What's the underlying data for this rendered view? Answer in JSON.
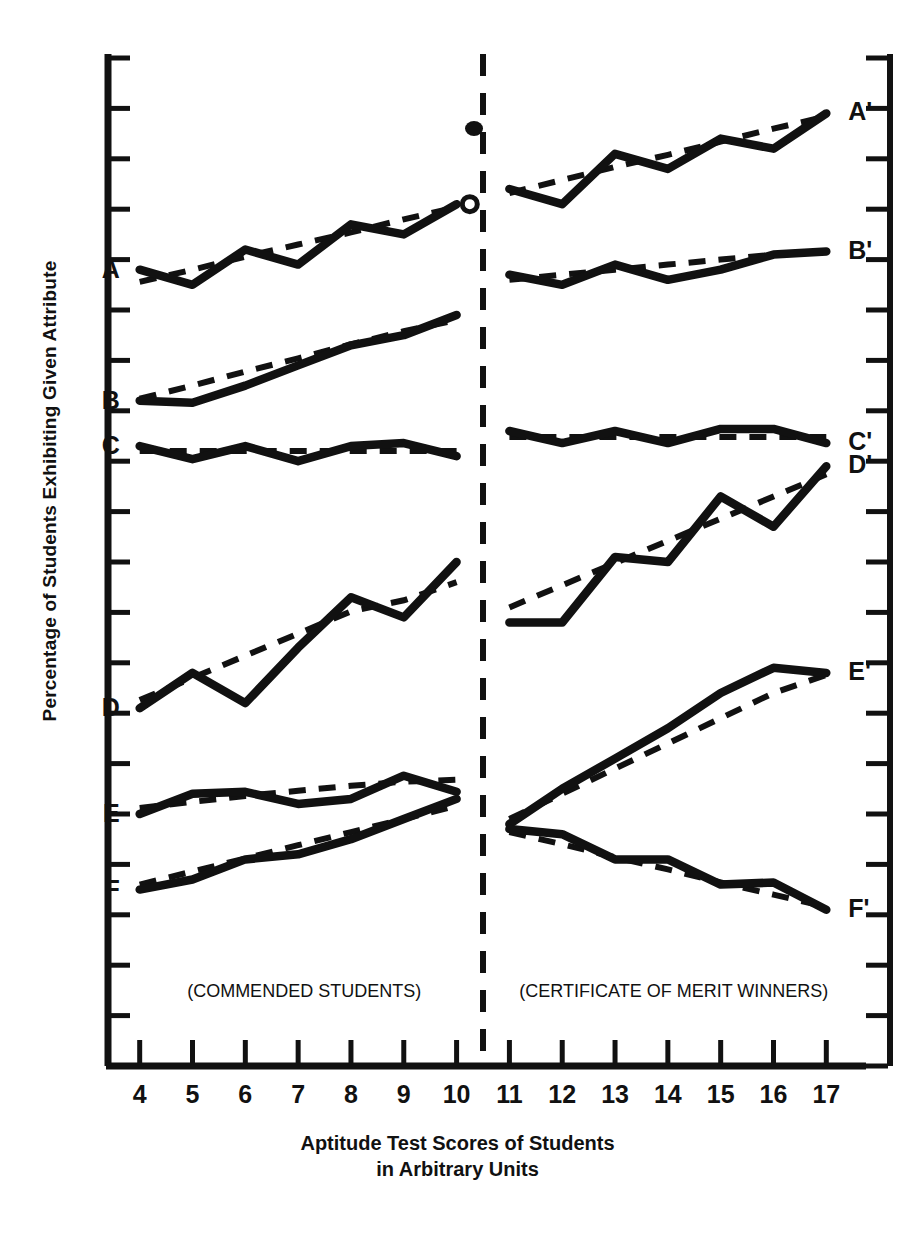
{
  "figure": {
    "ylabel": "Percentage of Students Exhibiting Given Attribute",
    "xtitle_line1": "Aptitude Test Scores of Students",
    "xtitle_line2": "in Arbitrary Units",
    "left_panel_caption": "(COMMENDED STUDENTS)",
    "right_panel_caption": "(CERTIFICATE OF MERIT WINNERS)",
    "ink_color": "#111111",
    "background_color": "#ffffff"
  },
  "chart_data": {
    "type": "line",
    "title": "",
    "xlabel": "Aptitude Test Scores of Students in Arbitrary Units",
    "ylabel": "Percentage of Students Exhibiting Given Attribute",
    "xlim": [
      3.4,
      17.6
    ],
    "ylim": [
      0,
      100
    ],
    "grid": false,
    "legend": "none",
    "axis_style": "left-spine-and-bottom-spine, unlabeled y ticks, tick marks outward",
    "y_axis_tick_count": 20,
    "y_axis_tick_labels": [],
    "x_ticks": [
      4,
      5,
      6,
      7,
      8,
      9,
      10,
      11,
      12,
      13,
      14,
      15,
      16,
      17
    ],
    "x_tick_labels": [
      "4",
      "5",
      "6",
      "7",
      "8",
      "9",
      "10",
      "11",
      "12",
      "13",
      "14",
      "15",
      "16",
      "17"
    ],
    "divider": {
      "x": 10.5,
      "style": "dashed-vertical",
      "label": "panel separator"
    },
    "panels": [
      {
        "name": "left",
        "caption": "(COMMENDED STUDENTS)",
        "x_range": [
          4,
          10
        ]
      },
      {
        "name": "right",
        "caption": "(CERTIFICATE OF MERIT WINNERS)",
        "x_range": [
          11,
          17
        ]
      }
    ],
    "series": [
      {
        "name": "A",
        "panel": "left",
        "label": "A",
        "label_side": "left",
        "x": [
          4,
          5,
          6,
          7,
          8,
          9,
          10
        ],
        "values": [
          79.0,
          77.5,
          81.0,
          79.5,
          83.5,
          82.5,
          85.5
        ],
        "trend": [
          77.8,
          79.0,
          80.3,
          81.5,
          82.7,
          84.0,
          85.2
        ]
      },
      {
        "name": "B",
        "panel": "left",
        "label": "B",
        "label_side": "left",
        "x": [
          4,
          5,
          6,
          7,
          8,
          9,
          10
        ],
        "values": [
          66.0,
          65.8,
          67.5,
          69.5,
          71.5,
          72.5,
          74.5
        ],
        "trend": [
          66.2,
          67.5,
          68.9,
          70.2,
          71.6,
          72.9,
          74.0
        ]
      },
      {
        "name": "C",
        "panel": "left",
        "label": "C",
        "label_side": "left",
        "x": [
          4,
          5,
          6,
          7,
          8,
          9,
          10
        ],
        "values": [
          61.5,
          60.2,
          61.5,
          60.0,
          61.5,
          61.8,
          60.5
        ],
        "trend": [
          61.0,
          61.0,
          61.0,
          61.0,
          61.0,
          61.0,
          61.0
        ]
      },
      {
        "name": "D",
        "panel": "left",
        "label": "D",
        "label_side": "left",
        "x": [
          4,
          5,
          6,
          7,
          8,
          9,
          10
        ],
        "values": [
          35.5,
          39.0,
          36.0,
          41.5,
          46.5,
          44.5,
          50.0
        ],
        "trend": [
          36.3,
          38.5,
          40.7,
          42.9,
          45.1,
          46.2,
          48.0
        ]
      },
      {
        "name": "E",
        "panel": "left",
        "label": "E",
        "label_side": "left",
        "x": [
          4,
          5,
          6,
          7,
          8,
          9,
          10
        ],
        "values": [
          25.0,
          27.0,
          27.2,
          26.0,
          26.5,
          28.8,
          27.2
        ],
        "trend": [
          25.6,
          26.2,
          26.8,
          27.3,
          27.8,
          28.2,
          28.4
        ]
      },
      {
        "name": "F",
        "panel": "left",
        "label": "F",
        "label_side": "left",
        "x": [
          4,
          5,
          6,
          7,
          8,
          9,
          10
        ],
        "values": [
          17.5,
          18.5,
          20.5,
          21.0,
          22.5,
          24.5,
          26.5
        ],
        "trend": [
          18.0,
          19.3,
          20.6,
          21.9,
          23.2,
          24.5,
          25.8
        ]
      },
      {
        "name": "A-prime",
        "panel": "right",
        "label": "A'",
        "label_side": "right",
        "x": [
          11,
          12,
          13,
          14,
          15,
          16,
          17
        ],
        "values": [
          87.0,
          85.5,
          90.5,
          89.0,
          92.0,
          91.0,
          94.5
        ],
        "trend": [
          86.6,
          87.9,
          89.2,
          90.4,
          91.7,
          93.0,
          94.2
        ]
      },
      {
        "name": "B-prime",
        "panel": "right",
        "label": "B'",
        "label_side": "right",
        "x": [
          11,
          12,
          13,
          14,
          15,
          16,
          17
        ],
        "values": [
          78.5,
          77.5,
          79.5,
          78.0,
          79.0,
          80.5,
          80.8
        ],
        "trend": [
          78.0,
          78.5,
          79.0,
          79.5,
          80.0,
          80.5,
          80.8
        ]
      },
      {
        "name": "C-prime",
        "panel": "right",
        "label": "C'",
        "label_side": "right",
        "x": [
          11,
          12,
          13,
          14,
          15,
          16,
          17
        ],
        "values": [
          63.0,
          61.8,
          63.0,
          61.8,
          63.2,
          63.2,
          61.8
        ],
        "trend": [
          62.4,
          62.4,
          62.4,
          62.4,
          62.4,
          62.4,
          62.4
        ]
      },
      {
        "name": "D-prime",
        "panel": "right",
        "label": "D'",
        "label_side": "right",
        "x": [
          11,
          12,
          13,
          14,
          15,
          16,
          17
        ],
        "values": [
          44.0,
          44.0,
          50.5,
          50.0,
          56.5,
          53.5,
          59.5
        ],
        "trend": [
          45.5,
          47.7,
          49.9,
          52.1,
          54.3,
          56.5,
          58.7
        ]
      },
      {
        "name": "E-prime",
        "panel": "right",
        "label": "E'",
        "label_side": "right",
        "x": [
          11,
          12,
          13,
          14,
          15,
          16,
          17
        ],
        "values": [
          24.0,
          27.5,
          30.5,
          33.5,
          37.0,
          39.5,
          39.0
        ],
        "trend": [
          24.5,
          27.0,
          29.5,
          32.0,
          34.5,
          37.0,
          38.8
        ]
      },
      {
        "name": "F-prime",
        "panel": "right",
        "label": "F'",
        "label_side": "right",
        "x": [
          11,
          12,
          13,
          14,
          15,
          16,
          17
        ],
        "values": [
          23.5,
          23.0,
          20.5,
          20.5,
          18.0,
          18.2,
          15.5
        ],
        "trend": [
          23.2,
          22.0,
          20.7,
          19.5,
          18.2,
          17.0,
          15.8
        ]
      }
    ],
    "notes": [
      "Each attribute is drawn twice: a heavy solid polyline through the data points and a light dashed straight-line trend fitted to it.",
      "Small filled ink blob artifact sits just left of the divider near the top of the plot.",
      "Small open circle artifact at the right end of curve A."
    ]
  },
  "artifacts": {
    "ink_blob": {
      "name": "ink-blob",
      "x": 10.33,
      "y": 93.0
    },
    "open_circle": {
      "name": "open-circle-marker",
      "x": 10.25,
      "y": 85.5
    }
  }
}
